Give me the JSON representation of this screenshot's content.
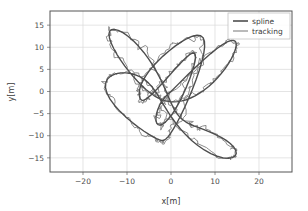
{
  "chart_data": {
    "type": "line",
    "title": "",
    "xlabel": "x[m]",
    "ylabel": "y[m]",
    "xlim": [
      -27.5,
      27.5
    ],
    "ylim": [
      -18.2,
      18.2
    ],
    "xticks": [
      -20,
      -10,
      0,
      10,
      20
    ],
    "yticks": [
      -15,
      -10,
      -5,
      0,
      5,
      10,
      15
    ],
    "xtick_labels": [
      "−20",
      "−10",
      "0",
      "10",
      "20"
    ],
    "ytick_labels": [
      "−15",
      "−10",
      "−5",
      "0",
      "5",
      "10",
      "15"
    ],
    "grid": true,
    "grid_color": "#d8d8d8",
    "legend_position": "upper right",
    "series": [
      {
        "name": "spline",
        "color": "#4d4d4d",
        "linewidth": 1.4,
        "description": "Smooth figure-eight (lemniscate) reference path, amplitude x ±15 m, y ±15 m",
        "points": [
          [
            0,
            0
          ],
          [
            1.95,
            1.95
          ],
          [
            3.86,
            3.82
          ],
          [
            5.7,
            5.58
          ],
          [
            7.43,
            7.18
          ],
          [
            9.03,
            8.57
          ],
          [
            10.46,
            9.72
          ],
          [
            11.71,
            10.6
          ],
          [
            12.76,
            11.2
          ],
          [
            13.6,
            11.52
          ],
          [
            14.22,
            11.56
          ],
          [
            14.62,
            11.35
          ],
          [
            14.82,
            10.9
          ],
          [
            14.81,
            10.25
          ],
          [
            14.61,
            9.42
          ],
          [
            14.24,
            8.46
          ],
          [
            13.72,
            7.42
          ],
          [
            13.07,
            6.32
          ],
          [
            12.31,
            5.2
          ],
          [
            11.46,
            4.1
          ],
          [
            10.54,
            3.04
          ],
          [
            9.57,
            2.05
          ],
          [
            8.57,
            1.14
          ],
          [
            7.54,
            0.33
          ],
          [
            6.51,
            -0.38
          ],
          [
            5.48,
            -0.98
          ],
          [
            4.46,
            -1.47
          ],
          [
            3.46,
            -1.86
          ],
          [
            2.48,
            -2.13
          ],
          [
            1.53,
            -2.29
          ],
          [
            0.6,
            -2.34
          ],
          [
            -0.31,
            -2.28
          ],
          [
            -1.2,
            -2.11
          ],
          [
            -2.09,
            -1.82
          ],
          [
            -2.98,
            -1.42
          ],
          [
            -3.87,
            -0.91
          ],
          [
            -4.78,
            -0.28
          ],
          [
            -5.7,
            0.47
          ],
          [
            -6.64,
            1.33
          ],
          [
            -7.6,
            2.3
          ],
          [
            -8.58,
            3.38
          ],
          [
            -9.56,
            4.55
          ],
          [
            -10.53,
            5.8
          ],
          [
            -11.45,
            7.1
          ],
          [
            -12.3,
            8.42
          ],
          [
            -13.03,
            9.72
          ],
          [
            -13.6,
            10.95
          ],
          [
            -13.97,
            12.04
          ],
          [
            -14.1,
            12.94
          ],
          [
            -13.96,
            13.6
          ],
          [
            -13.55,
            13.98
          ],
          [
            -12.88,
            14.06
          ],
          [
            -11.99,
            13.83
          ],
          [
            -10.93,
            13.3
          ],
          [
            -9.77,
            12.49
          ],
          [
            -8.56,
            11.45
          ],
          [
            -7.35,
            10.21
          ],
          [
            -6.18,
            8.83
          ],
          [
            -5.09,
            7.36
          ],
          [
            -4.09,
            5.84
          ],
          [
            -3.2,
            4.31
          ],
          [
            -2.41,
            2.82
          ],
          [
            -1.72,
            1.38
          ],
          [
            -1.11,
            0.03
          ],
          [
            -0.57,
            -1.23
          ],
          [
            -0.07,
            -2.38
          ],
          [
            0.41,
            -3.41
          ],
          [
            0.9,
            -4.32
          ],
          [
            1.42,
            -5.12
          ],
          [
            2.0,
            -5.8
          ],
          [
            2.65,
            -6.39
          ],
          [
            3.4,
            -6.9
          ],
          [
            4.26,
            -7.35
          ],
          [
            5.23,
            -7.77
          ],
          [
            6.32,
            -8.19
          ],
          [
            7.5,
            -8.63
          ],
          [
            8.75,
            -9.12
          ],
          [
            10.03,
            -9.68
          ],
          [
            11.29,
            -10.3
          ],
          [
            12.46,
            -11.0
          ],
          [
            13.47,
            -11.75
          ],
          [
            14.24,
            -12.53
          ],
          [
            14.71,
            -13.3
          ],
          [
            14.83,
            -14.0
          ],
          [
            14.57,
            -14.57
          ],
          [
            13.96,
            -14.95
          ],
          [
            13.03,
            -15.1
          ],
          [
            11.85,
            -15.0
          ],
          [
            10.5,
            -14.64
          ],
          [
            9.05,
            -14.04
          ],
          [
            7.57,
            -13.22
          ],
          [
            6.1,
            -12.21
          ],
          [
            4.69,
            -11.06
          ],
          [
            3.37,
            -9.8
          ],
          [
            2.16,
            -8.47
          ],
          [
            1.06,
            -7.12
          ],
          [
            0.08,
            -5.77
          ],
          [
            -0.79,
            -4.45
          ],
          [
            -1.57,
            -3.19
          ],
          [
            -2.28,
            -2.0
          ],
          [
            -2.96,
            -0.89
          ],
          [
            -3.63,
            0.13
          ],
          [
            -4.33,
            1.07
          ],
          [
            -5.09,
            1.9
          ],
          [
            -5.93,
            2.63
          ],
          [
            -6.87,
            3.24
          ],
          [
            -7.92,
            3.72
          ],
          [
            -9.06,
            4.05
          ],
          [
            -10.26,
            4.22
          ],
          [
            -11.47,
            4.2
          ],
          [
            -12.62,
            3.98
          ],
          [
            -13.62,
            3.54
          ],
          [
            -14.38,
            2.87
          ],
          [
            -14.82,
            1.98
          ],
          [
            -14.89,
            0.89
          ],
          [
            -14.56,
            -0.36
          ],
          [
            -13.86,
            -1.71
          ],
          [
            -12.85,
            -3.1
          ],
          [
            -11.6,
            -4.49
          ],
          [
            -10.21,
            -5.81
          ],
          [
            -8.78,
            -7.03
          ],
          [
            -7.39,
            -8.09
          ],
          [
            -6.12,
            -8.99
          ],
          [
            -5.0,
            -9.71
          ],
          [
            -4.06,
            -10.26
          ],
          [
            -3.3,
            -10.65
          ],
          [
            -2.7,
            -10.91
          ],
          [
            -2.24,
            -11.05
          ],
          [
            -1.86,
            -11.07
          ],
          [
            -1.5,
            -10.96
          ],
          [
            -1.11,
            -10.68
          ],
          [
            -0.65,
            -10.2
          ],
          [
            -0.1,
            -9.47
          ],
          [
            0.55,
            -8.47
          ],
          [
            1.3,
            -7.18
          ],
          [
            2.13,
            -5.6
          ],
          [
            3.02,
            -3.77
          ],
          [
            3.93,
            -1.74
          ],
          [
            4.83,
            0.4
          ],
          [
            5.67,
            2.6
          ],
          [
            6.42,
            4.75
          ],
          [
            7.02,
            6.77
          ],
          [
            7.44,
            8.58
          ],
          [
            7.64,
            10.1
          ],
          [
            7.6,
            11.3
          ],
          [
            7.3,
            12.14
          ],
          [
            6.74,
            12.61
          ],
          [
            5.92,
            12.72
          ],
          [
            4.89,
            12.5
          ],
          [
            3.67,
            11.98
          ],
          [
            2.33,
            11.22
          ],
          [
            0.93,
            10.26
          ],
          [
            -0.47,
            9.17
          ],
          [
            -1.82,
            8.0
          ],
          [
            -3.06,
            6.8
          ],
          [
            -4.15,
            5.62
          ],
          [
            -5.07,
            4.48
          ],
          [
            -5.81,
            3.43
          ],
          [
            -6.37,
            2.47
          ],
          [
            -6.77,
            1.62
          ],
          [
            -7.03,
            0.86
          ],
          [
            -7.17,
            0.2
          ],
          [
            -7.22,
            -0.38
          ],
          [
            -7.2,
            -0.88
          ],
          [
            -7.12,
            -1.29
          ],
          [
            -7.0,
            -1.62
          ],
          [
            -6.83,
            -1.85
          ],
          [
            -6.62,
            -1.98
          ],
          [
            -6.36,
            -2.0
          ],
          [
            -6.04,
            -1.9
          ],
          [
            -5.64,
            -1.68
          ],
          [
            -5.16,
            -1.32
          ],
          [
            -4.58,
            -0.82
          ],
          [
            -3.9,
            -0.17
          ],
          [
            -3.11,
            0.62
          ],
          [
            -2.23,
            1.56
          ],
          [
            -1.28,
            2.6
          ],
          [
            -0.29,
            3.71
          ],
          [
            0.72,
            4.84
          ],
          [
            1.71,
            5.92
          ],
          [
            2.64,
            6.9
          ],
          [
            3.49,
            7.72
          ],
          [
            4.21,
            8.32
          ],
          [
            4.8,
            8.66
          ],
          [
            5.22,
            8.7
          ],
          [
            5.48,
            8.43
          ],
          [
            5.56,
            7.84
          ],
          [
            5.47,
            6.94
          ],
          [
            5.2,
            5.76
          ],
          [
            4.78,
            4.35
          ],
          [
            4.22,
            2.78
          ],
          [
            3.55,
            1.11
          ],
          [
            2.79,
            -0.58
          ],
          [
            1.98,
            -2.22
          ],
          [
            1.14,
            -3.74
          ],
          [
            0.3,
            -5.06
          ],
          [
            -0.52,
            -6.13
          ],
          [
            -1.27,
            -6.92
          ],
          [
            -1.94,
            -7.41
          ],
          [
            -2.5,
            -7.6
          ],
          [
            -2.95,
            -7.5
          ],
          [
            -3.25,
            -7.14
          ],
          [
            -3.41,
            -6.56
          ],
          [
            -3.42,
            -5.81
          ],
          [
            -3.27,
            -4.94
          ],
          [
            -2.98,
            -4.0
          ],
          [
            -2.55,
            -3.05
          ],
          [
            -2.0,
            -2.13
          ],
          [
            -1.36,
            -1.28
          ],
          [
            -0.64,
            -0.53
          ],
          [
            0,
            0
          ]
        ]
      },
      {
        "name": "tracking",
        "color": "#8c8c8c",
        "linewidth": 1.0,
        "description": "Noisy measured tracking path following the spline with jitter, occasional loops and spikes",
        "noise_amplitude": 0.75,
        "noise_seed": 20240517
      }
    ]
  },
  "legend": {
    "entries": [
      {
        "label": "spline",
        "color": "#4d4d4d"
      },
      {
        "label": "tracking",
        "color": "#8c8c8c"
      }
    ]
  },
  "axes": {
    "spine_color": "#555555",
    "tick_color": "#777777",
    "background": "#ffffff"
  }
}
